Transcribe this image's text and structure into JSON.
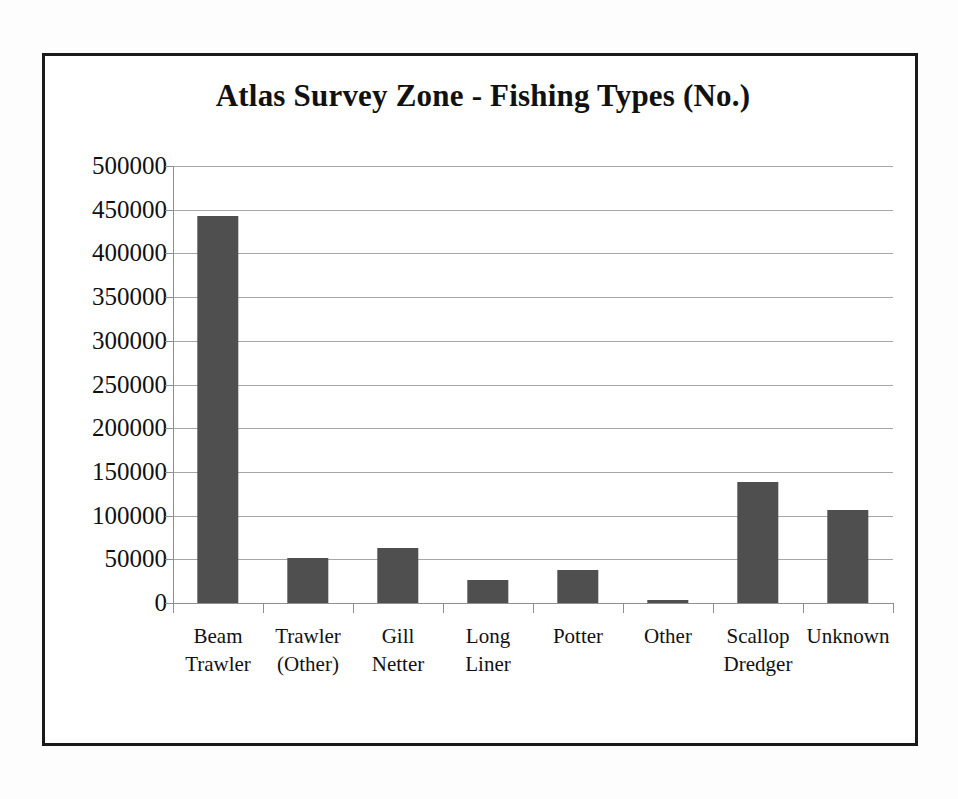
{
  "chart_data": {
    "type": "bar",
    "title": "Atlas Survey Zone - Fishing Types (No.)",
    "xlabel": "",
    "ylabel": "",
    "ylim": [
      0,
      500000
    ],
    "ytick_step": 50000,
    "grid": true,
    "legend": "none",
    "bar_color": "#4f4f4f",
    "gridline_color": "#a6a6a6",
    "axis_color": "#8f8f8f",
    "frame_color": "#1a1a1a",
    "categories": [
      "Beam Trawler",
      "Trawler (Other)",
      "Gill Netter",
      "Long Liner",
      "Potter",
      "Other",
      "Scallop Dredger",
      "Unknown"
    ],
    "category_lines": [
      [
        "Beam",
        "Trawler"
      ],
      [
        "Trawler",
        "(Other)"
      ],
      [
        "Gill Netter"
      ],
      [
        "Long",
        "Liner"
      ],
      [
        "Potter"
      ],
      [
        "Other"
      ],
      [
        "Scallop",
        "Dredger"
      ],
      [
        "Unknown"
      ]
    ],
    "values": [
      443000,
      52000,
      63000,
      26000,
      38000,
      3000,
      139000,
      106000
    ],
    "ytick_labels": [
      "500000",
      "450000",
      "400000",
      "350000",
      "300000",
      "250000",
      "200000",
      "150000",
      "100000",
      "50000",
      "0"
    ],
    "ytick_values": [
      500000,
      450000,
      400000,
      350000,
      300000,
      250000,
      200000,
      150000,
      100000,
      50000,
      0
    ]
  }
}
